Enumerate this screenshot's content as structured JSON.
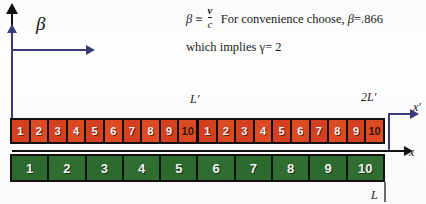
{
  "slide": {
    "title": "Length contraction ruler diagram",
    "background": "#fefefe"
  },
  "axes": {
    "beta_label": "β",
    "beta_arrow_color": "#3b3b7a",
    "vertical_arrow_color": "#111111",
    "x_label": "x",
    "x_prime_label": "x′",
    "x_axis_color": "#111111",
    "x_prime_axis_color": "#3b3b7a"
  },
  "formula": {
    "beta_symbol": "β",
    "identity": "≡",
    "numerator": "v",
    "denominator": "c",
    "sentence": "For convenience choose,",
    "beta_value_symbol": "β",
    "beta_value": "=.866",
    "line2_prefix": "which implies",
    "gamma_symbol": "γ",
    "gamma_value": "= 2"
  },
  "measures": {
    "half_label": "L′",
    "full_label": "2L′",
    "rest_label": "L"
  },
  "strips": {
    "primed": {
      "name": "moving-contracted-ruler",
      "color": "#d6401f",
      "cells": [
        {
          "label": "1",
          "smudged": false
        },
        {
          "label": "2",
          "smudged": false
        },
        {
          "label": "3",
          "smudged": false
        },
        {
          "label": "4",
          "smudged": false
        },
        {
          "label": "5",
          "smudged": false
        },
        {
          "label": "6",
          "smudged": false
        },
        {
          "label": "7",
          "smudged": false
        },
        {
          "label": "8",
          "smudged": false
        },
        {
          "label": "9",
          "smudged": false
        },
        {
          "label": "10",
          "smudged": true
        },
        {
          "label": "1",
          "smudged": false
        },
        {
          "label": "2",
          "smudged": false
        },
        {
          "label": "3",
          "smudged": false
        },
        {
          "label": "4",
          "smudged": false
        },
        {
          "label": "5",
          "smudged": false
        },
        {
          "label": "6",
          "smudged": false
        },
        {
          "label": "7",
          "smudged": false
        },
        {
          "label": "8",
          "smudged": false
        },
        {
          "label": "9",
          "smudged": false
        },
        {
          "label": "10",
          "smudged": true
        }
      ]
    },
    "rest": {
      "name": "rest-frame-ruler",
      "color": "#2d6b2e",
      "cells": [
        {
          "label": "1"
        },
        {
          "label": "2"
        },
        {
          "label": "3"
        },
        {
          "label": "4"
        },
        {
          "label": "5"
        },
        {
          "label": "6"
        },
        {
          "label": "7"
        },
        {
          "label": "8"
        },
        {
          "label": "9"
        },
        {
          "label": "10"
        }
      ]
    }
  }
}
